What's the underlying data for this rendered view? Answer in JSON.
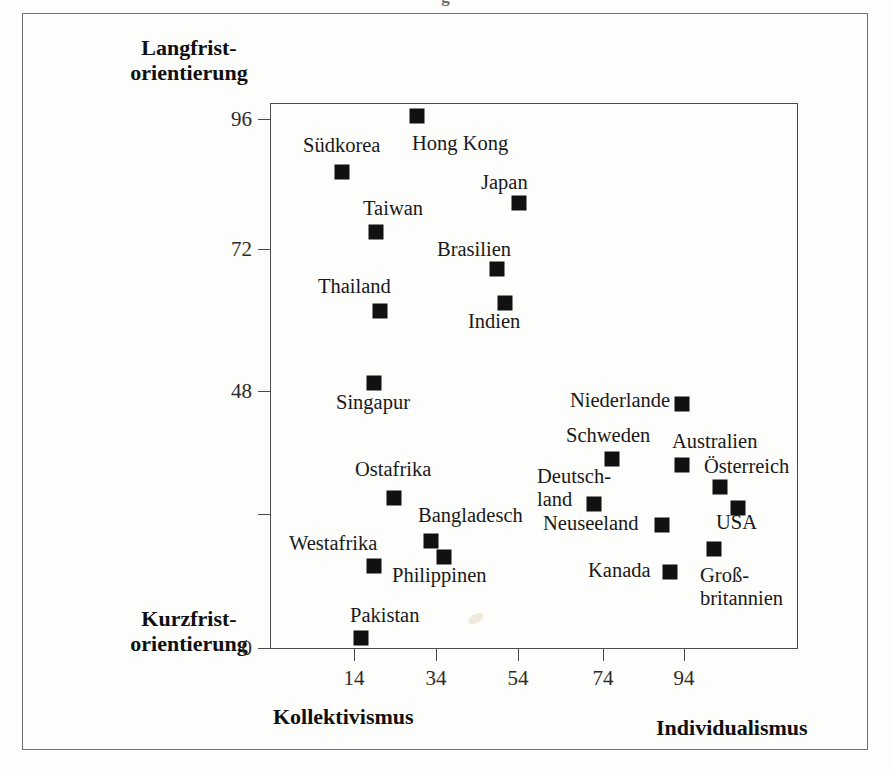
{
  "figure": {
    "title_sliver": "g",
    "axis_titles": {
      "y_top_line1": "Langfrist-",
      "y_top_line2": "orientierung",
      "y_bottom_line1": "Kurzfrist-",
      "y_bottom_line2": "orientierung",
      "x_left": "Kollektivismus",
      "x_right": "Individualismus"
    },
    "colors": {
      "marker": "#111111",
      "axis": "#4a4a4a",
      "frame": "#6f6f6f",
      "text": "#191919",
      "background": "#fdfdfc"
    }
  },
  "chart_data": {
    "type": "scatter",
    "title": "",
    "xlabel": "Kollektivismus – Individualismus",
    "ylabel": "Kurzfristorientierung – Langfristorientierung",
    "xlim": [
      0,
      108
    ],
    "ylim": [
      0,
      100
    ],
    "grid": false,
    "legend": "none",
    "xticks": [
      14,
      34,
      54,
      74,
      94
    ],
    "xticklabels": [
      "14",
      "34",
      "54",
      "74",
      "94"
    ],
    "yticks": [
      0,
      24,
      48,
      72,
      96
    ],
    "yticklabels": [
      "0",
      "",
      "48",
      "72",
      "96"
    ],
    "points": [
      {
        "label": "Hong Kong",
        "x": 29,
        "y": 96,
        "label_pos": "below"
      },
      {
        "label": "Südkorea",
        "x": 18,
        "y": 86,
        "label_pos": "above"
      },
      {
        "label": "Japan",
        "x": 46,
        "y": 80,
        "label_pos": "above"
      },
      {
        "label": "Taiwan",
        "x": 22,
        "y": 74,
        "label_pos": "above"
      },
      {
        "label": "Brasilien",
        "x": 38,
        "y": 67,
        "label_pos": "above"
      },
      {
        "label": "Indien",
        "x": 48,
        "y": 61,
        "label_pos": "below"
      },
      {
        "label": "Thailand",
        "x": 20,
        "y": 59,
        "label_pos": "above"
      },
      {
        "label": "Singapur",
        "x": 20,
        "y": 48,
        "label_pos": "below"
      },
      {
        "label": "Niederlande",
        "x": 80,
        "y": 44,
        "label_pos": "left"
      },
      {
        "label": "Schweden",
        "x": 71,
        "y": 34,
        "label_pos": "above"
      },
      {
        "label": "Australien",
        "x": 90,
        "y": 31,
        "label_pos": "above"
      },
      {
        "label": "Österreich",
        "x": 55,
        "y": 28,
        "label_pos": "above"
      },
      {
        "label": "Ostafrika",
        "x": 27,
        "y": 25,
        "label_pos": "above"
      },
      {
        "label": "Deutsch-land",
        "x": 67,
        "y": 31,
        "label_pos": "left"
      },
      {
        "label": "USA",
        "x": 91,
        "y": 29,
        "label_pos": "right"
      },
      {
        "label": "Neuseeland",
        "x": 79,
        "y": 30,
        "label_pos": "left"
      },
      {
        "label": "Bangladesch",
        "x": 20,
        "y": 40,
        "label_pos": "above"
      },
      {
        "label": "Westafrika",
        "x": 20,
        "y": 16,
        "label_pos": "left"
      },
      {
        "label": "Philippinen",
        "x": 19,
        "y": 19,
        "label_pos": "below"
      },
      {
        "label": "Kanada",
        "x": 80,
        "y": 23,
        "label_pos": "left"
      },
      {
        "label": "Groß-britannien",
        "x": 89,
        "y": 25,
        "label_pos": "below"
      },
      {
        "label": "Pakistan",
        "x": 14,
        "y": 0,
        "label_pos": "above"
      }
    ],
    "markers_px": [
      {
        "name": "hong-kong",
        "cx": 416,
        "cy": 115
      },
      {
        "name": "suedkorea",
        "cx": 341,
        "cy": 171
      },
      {
        "name": "japan",
        "cx": 518,
        "cy": 202
      },
      {
        "name": "taiwan",
        "cx": 375,
        "cy": 231
      },
      {
        "name": "brasilien",
        "cx": 496,
        "cy": 268
      },
      {
        "name": "indien",
        "cx": 504,
        "cy": 302
      },
      {
        "name": "thailand",
        "cx": 379,
        "cy": 310
      },
      {
        "name": "singapur",
        "cx": 373,
        "cy": 382
      },
      {
        "name": "niederlande",
        "cx": 681,
        "cy": 403
      },
      {
        "name": "schweden",
        "cx": 611,
        "cy": 458
      },
      {
        "name": "australien",
        "cx": 681,
        "cy": 464
      },
      {
        "name": "oesterreich",
        "cx": 719,
        "cy": 486
      },
      {
        "name": "ostafrika",
        "cx": 393,
        "cy": 497
      },
      {
        "name": "deutschland",
        "cx": 593,
        "cy": 503
      },
      {
        "name": "usa",
        "cx": 737,
        "cy": 507
      },
      {
        "name": "neuseeland",
        "cx": 661,
        "cy": 524
      },
      {
        "name": "bangladesch",
        "cx": 430,
        "cy": 540
      },
      {
        "name": "grossbritannien",
        "cx": 713,
        "cy": 548
      },
      {
        "name": "philippinen",
        "cx": 443,
        "cy": 556
      },
      {
        "name": "westafrika",
        "cx": 373,
        "cy": 565
      },
      {
        "name": "kanada",
        "cx": 669,
        "cy": 571
      },
      {
        "name": "pakistan",
        "cx": 360,
        "cy": 637
      }
    ],
    "labels_px": [
      {
        "name": "suedkorea",
        "text": "Südkorea",
        "x": 303,
        "y": 135
      },
      {
        "name": "hong-kong",
        "text": "Hong Kong",
        "x": 412,
        "y": 133
      },
      {
        "name": "japan",
        "text": "Japan",
        "x": 481,
        "y": 172
      },
      {
        "name": "taiwan",
        "text": "Taiwan",
        "x": 363,
        "y": 198
      },
      {
        "name": "brasilien",
        "text": "Brasilien",
        "x": 437,
        "y": 239
      },
      {
        "name": "thailand",
        "text": "Thailand",
        "x": 318,
        "y": 276
      },
      {
        "name": "indien",
        "text": "Indien",
        "x": 468,
        "y": 311
      },
      {
        "name": "singapur",
        "text": "Singapur",
        "x": 336,
        "y": 392
      },
      {
        "name": "niederlande",
        "text": "Niederlande",
        "x": 570,
        "y": 390
      },
      {
        "name": "schweden",
        "text": "Schweden",
        "x": 566,
        "y": 425
      },
      {
        "name": "australien",
        "text": "Australien",
        "x": 672,
        "y": 431
      },
      {
        "name": "oesterreich",
        "text": "Österreich",
        "x": 704,
        "y": 456
      },
      {
        "name": "ostafrika",
        "text": "Ostafrika",
        "x": 355,
        "y": 459
      },
      {
        "name": "deutschland-1",
        "text": "Deutsch-",
        "x": 537,
        "y": 466
      },
      {
        "name": "deutschland-2",
        "text": "land",
        "x": 537,
        "y": 489
      },
      {
        "name": "bangladesch",
        "text": "Bangladesch",
        "x": 418,
        "y": 505
      },
      {
        "name": "usa",
        "text": "USA",
        "x": 716,
        "y": 512
      },
      {
        "name": "neuseeland",
        "text": "Neuseeland",
        "x": 543,
        "y": 513
      },
      {
        "name": "westafrika",
        "text": "Westafrika",
        "x": 289,
        "y": 533
      },
      {
        "name": "philippinen",
        "text": "Philippinen",
        "x": 392,
        "y": 565
      },
      {
        "name": "kanada",
        "text": "Kanada",
        "x": 588,
        "y": 560
      },
      {
        "name": "grossbritannien-1",
        "text": "Groß-",
        "x": 700,
        "y": 565
      },
      {
        "name": "grossbritannien-2",
        "text": "britannien",
        "x": 700,
        "y": 588
      },
      {
        "name": "pakistan",
        "text": "Pakistan",
        "x": 350,
        "y": 605
      }
    ]
  }
}
